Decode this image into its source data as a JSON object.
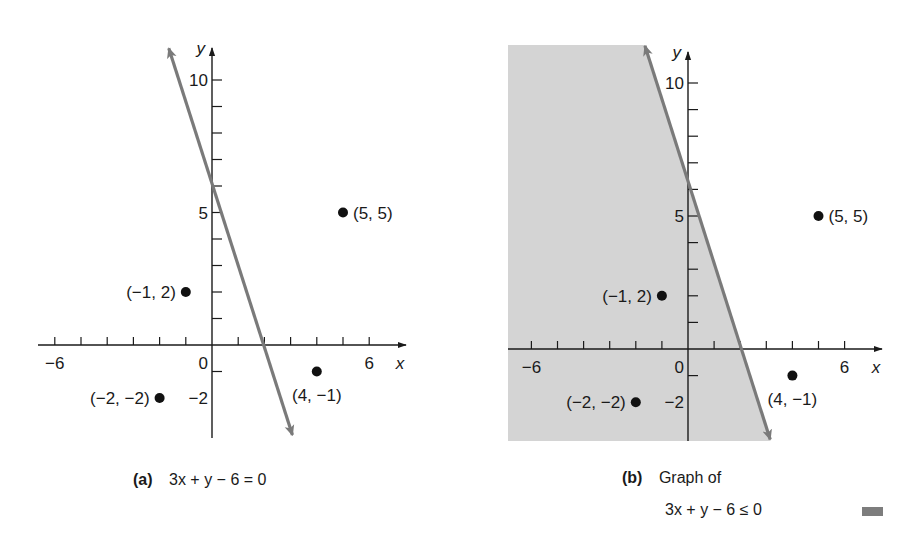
{
  "figure": {
    "panels": [
      {
        "id": "a",
        "caption_tag": "(a)",
        "caption_text": "3x + y − 6 = 0",
        "origin_px": [
          212,
          345
        ],
        "unit_px": [
          26.2,
          26.5
        ],
        "x_axis": {
          "left_px": 38,
          "right_px": 406,
          "label": "x",
          "tick_min": -6,
          "tick_max": 6,
          "tick_labels": [
            {
              "value": -6,
              "text": "−6"
            },
            {
              "value": 6,
              "text": "6"
            }
          ]
        },
        "y_axis": {
          "top_px": 48,
          "bottom_px": 438,
          "label": "y",
          "tick_min": -3,
          "tick_max": 10,
          "tick_labels": [
            {
              "value": 10,
              "text": "10"
            },
            {
              "value": 5,
              "text": "5"
            },
            {
              "value": -2,
              "text": "−2"
            }
          ]
        },
        "origin_label": "0",
        "line": {
          "from": [
            -1.65,
            11.2
          ],
          "to": [
            3.07,
            -3.4
          ]
        },
        "shaded": false
      },
      {
        "id": "b",
        "caption_tag": "(b)",
        "caption_text_line1": "Graph of",
        "caption_text": "3x + y − 6 ≤ 0",
        "origin_px": [
          688,
          349
        ],
        "unit_px": [
          26.1,
          26.6
        ],
        "x_axis": {
          "left_px": 508,
          "right_px": 882,
          "label": "x",
          "tick_min": -6,
          "tick_max": 6,
          "tick_labels": [
            {
              "value": -6,
              "text": "−6"
            },
            {
              "value": 6,
              "text": "6"
            }
          ]
        },
        "y_axis": {
          "top_px": 52,
          "bottom_px": 441,
          "label": "y",
          "tick_min": -3,
          "tick_max": 10,
          "tick_labels": [
            {
              "value": 10,
              "text": "10"
            },
            {
              "value": 5,
              "text": "5"
            },
            {
              "value": -2,
              "text": "−2"
            }
          ]
        },
        "origin_label": "0",
        "line": {
          "from": [
            -1.65,
            11.4
          ],
          "to": [
            3.15,
            -3.4
          ]
        },
        "shaded": true,
        "shade_rect_px": {
          "left": 508,
          "top": 45,
          "bottom": 441
        }
      }
    ],
    "points": [
      {
        "x": 5,
        "y": 5,
        "label": "(5, 5)",
        "label_side": "right"
      },
      {
        "x": -1,
        "y": 2,
        "label": "(−1, 2)",
        "label_side": "left"
      },
      {
        "x": -2,
        "y": -2,
        "label": "(−2, −2)",
        "label_side": "left"
      },
      {
        "x": 4,
        "y": -1,
        "label": "(4, −1)",
        "label_side": "below"
      }
    ],
    "colors": {
      "axis": "#1a1a1a",
      "line": "#7a7a7a",
      "shade": "#d4d4d4",
      "point": "#111111",
      "text": "#1a1a1a"
    }
  },
  "captions": {
    "a": {
      "tag": "(a)",
      "text": "3x + y − 6 = 0"
    },
    "b": {
      "tag": "(b)",
      "line1": "Graph of",
      "line2": "3x + y − 6 ≤ 0"
    }
  }
}
